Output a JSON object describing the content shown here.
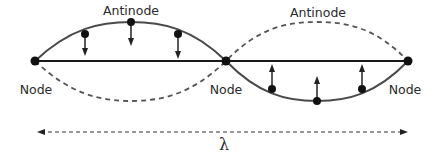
{
  "diagram": {
    "type": "standing-wave",
    "labels": {
      "antinode_left": "Antinode",
      "antinode_right": "Antinode",
      "node_left": "Node",
      "node_middle": "Node",
      "node_right": "Node",
      "wavelength": "λ"
    },
    "colors": {
      "wave": "#4a4a4a",
      "baseline": "#1a1a1a",
      "dashed": "#555555",
      "dot": "#111111"
    },
    "nodes": [
      {
        "x": 35,
        "y": 61
      },
      {
        "x": 226,
        "y": 61
      },
      {
        "x": 408,
        "y": 61
      }
    ],
    "arrows_down": [
      {
        "x": 85,
        "y": 34
      },
      {
        "x": 131,
        "y": 22
      },
      {
        "x": 178,
        "y": 34
      }
    ],
    "arrows_up": [
      {
        "x": 272,
        "y": 89
      },
      {
        "x": 317,
        "y": 101
      },
      {
        "x": 362,
        "y": 89
      }
    ]
  }
}
